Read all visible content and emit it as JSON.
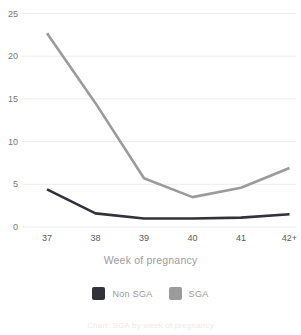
{
  "chart_data": {
    "type": "line",
    "x": [
      "37",
      "38",
      "39",
      "40",
      "41",
      "42+"
    ],
    "series": [
      {
        "name": "Non SGA",
        "color": "#32323a",
        "values": [
          4.4,
          1.6,
          1.0,
          1.0,
          1.1,
          1.5
        ]
      },
      {
        "name": "SGA",
        "color": "#9b9b9b",
        "values": [
          22.7,
          14.5,
          5.7,
          3.5,
          4.6,
          6.9
        ]
      }
    ],
    "title": "",
    "xlabel": "Week of pregnancy",
    "ylabel": "",
    "ylim": [
      0,
      25
    ],
    "yticks": [
      0,
      5,
      10,
      15,
      20,
      25
    ],
    "grid": true,
    "legend_position": "bottom"
  },
  "axis": {
    "x_label": "Week of pregnancy"
  },
  "legend": {
    "items": [
      {
        "label": "Non SGA",
        "color": "#32323a"
      },
      {
        "label": "SGA",
        "color": "#9b9b9b"
      }
    ]
  },
  "footer": {
    "caption": "Chart: SGA by week of pregnancy"
  }
}
